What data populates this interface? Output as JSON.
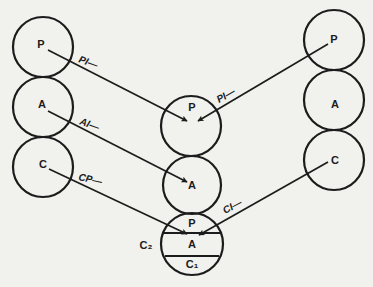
{
  "diagram": {
    "colors": {
      "background": "#f1f1ee",
      "ink": "#1c1c1c"
    },
    "left_column": [
      {
        "label": "P"
      },
      {
        "label": "A"
      },
      {
        "label": "C"
      }
    ],
    "right_column": [
      {
        "label": "P"
      },
      {
        "label": "A"
      },
      {
        "label": "C"
      }
    ],
    "middle_column": {
      "top": {
        "label": "P"
      },
      "middle": {
        "label": "A"
      },
      "bottom": {
        "side_label": "C₂",
        "segments": [
          "P",
          "A",
          "C₁"
        ]
      }
    },
    "edges": [
      {
        "from": "left.P",
        "to": "middle.P",
        "label": "PI—"
      },
      {
        "from": "left.A",
        "to": "middle.A",
        "label": "AI—"
      },
      {
        "from": "left.C",
        "to": "middle.bottom.P",
        "label": "CP—"
      },
      {
        "from": "right.P",
        "to": "middle.P",
        "label": "PI—"
      },
      {
        "from": "right.C",
        "to": "middle.bottom.P",
        "label": "CI—"
      }
    ]
  }
}
